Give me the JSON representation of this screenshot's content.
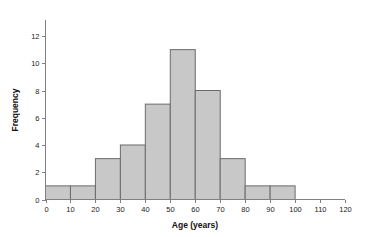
{
  "chart_data": {
    "type": "bar",
    "title": "",
    "subtitle": "",
    "xlabel": "Age (years)",
    "ylabel": "Frequency",
    "xlim": [
      0,
      120
    ],
    "ylim": [
      0,
      12
    ],
    "grid": false,
    "legend": null,
    "bin_width": 10,
    "bin_edges": [
      0,
      10,
      20,
      30,
      40,
      50,
      60,
      70,
      80,
      90,
      100
    ],
    "categories": [
      "0-10",
      "10-20",
      "20-30",
      "30-40",
      "40-50",
      "50-60",
      "60-70",
      "70-80",
      "80-90",
      "90-100"
    ],
    "values": [
      1,
      1,
      3,
      4,
      7,
      11,
      8,
      3,
      1,
      1
    ],
    "x_tick_labels": [
      "0",
      "10",
      "20",
      "30",
      "40",
      "50",
      "60",
      "70",
      "80",
      "90",
      "100",
      "110",
      "120"
    ],
    "x_tick_values": [
      0,
      10,
      20,
      30,
      40,
      50,
      60,
      70,
      80,
      90,
      100,
      110,
      120
    ],
    "y_tick_labels": [
      "0",
      "2",
      "4",
      "6",
      "8",
      "10",
      "12"
    ],
    "y_tick_values": [
      0,
      2,
      4,
      6,
      8,
      10,
      12
    ],
    "bar_fill_color": "#c8c8c8",
    "bar_edge_color": "#6b6b6b",
    "axis_color": "#808080",
    "background_color": "#ffffff"
  }
}
